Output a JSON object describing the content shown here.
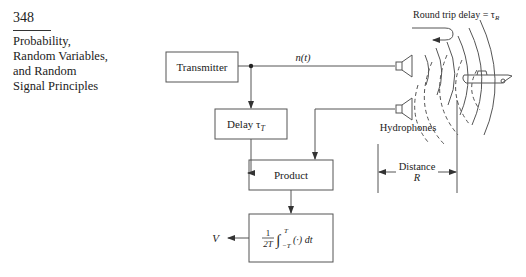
{
  "page": {
    "number": "348",
    "section_title": [
      "Probability,",
      "Random Variables,",
      "and Random",
      "Signal Principles"
    ]
  },
  "diagram": {
    "blocks": {
      "transmitter": "Transmitter",
      "delay": "Delay τ",
      "delay_sub": "T",
      "product": "Product",
      "integrator_num": "1",
      "integrator_den": "2T",
      "integrator_expr": "∫",
      "integrator_upper": "T",
      "integrator_lower": "−T",
      "integrator_tail": "(·) dt"
    },
    "labels": {
      "signal": "n(t)",
      "round_trip": "Round trip delay = τ",
      "round_trip_sub": "R",
      "hydrophones": "Hydrophones",
      "distance": "Distance",
      "distance_symbol": "R",
      "output": "V"
    }
  }
}
